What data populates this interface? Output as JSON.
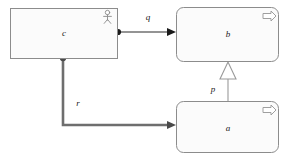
{
  "diagram": {
    "kind": "uml-class-diagram",
    "canvas": {
      "width": 287,
      "height": 161,
      "background": "#ffffff"
    },
    "style": {
      "node_stroke": "#808080",
      "node_fill": "#fbfbfb",
      "thin_edge_stroke": "#2b2b2b",
      "thick_edge_stroke": "#6e6e6e",
      "generalization_stroke": "#9a9a9a",
      "icon_stroke": "#9a9a9a",
      "label_color": "#1a1a1a"
    },
    "nodes": [
      {
        "id": "c",
        "label": "c",
        "shape": "rectangle",
        "corner": "sharp",
        "x": 10,
        "y": 8,
        "width": 107,
        "height": 50,
        "icon": "actor-icon",
        "icon_title": "actor"
      },
      {
        "id": "b",
        "label": "b",
        "shape": "rounded-rectangle",
        "corner": "rounded",
        "x": 176,
        "y": 7,
        "width": 103,
        "height": 55,
        "icon": "arrow-right-outline-icon",
        "icon_title": "process"
      },
      {
        "id": "a",
        "label": "a",
        "shape": "rounded-rectangle",
        "corner": "rounded",
        "x": 176,
        "y": 101,
        "width": 103,
        "height": 52,
        "icon": "arrow-right-outline-icon",
        "icon_title": "process"
      }
    ],
    "edges": [
      {
        "id": "q",
        "label": "q",
        "label_x": 148,
        "label_y": 20,
        "source": "c",
        "target": "b",
        "source_decoration": "filled-circle",
        "target_decoration": "solid-arrowhead",
        "weight": "thin",
        "routing": "straight"
      },
      {
        "id": "p",
        "label": "p",
        "label_x": 213,
        "label_y": 90,
        "source": "a",
        "target": "b",
        "source_decoration": "none",
        "target_decoration": "hollow-triangle",
        "weight": "thin",
        "routing": "straight"
      },
      {
        "id": "r",
        "label": "r",
        "label_x": 76,
        "label_y": 105,
        "source": "c",
        "target": "a",
        "source_decoration": "filled-circle",
        "target_decoration": "solid-arrowhead",
        "weight": "thick",
        "routing": "orthogonal"
      }
    ]
  }
}
